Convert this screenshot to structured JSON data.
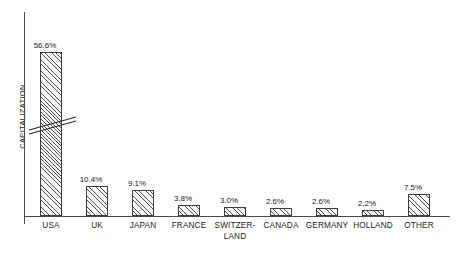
{
  "chart_data": {
    "type": "bar",
    "title": "",
    "xlabel": "",
    "ylabel": "CAPITALIZATION",
    "categories": [
      "USA",
      "UK",
      "JAPAN",
      "FRANCE",
      "SWITZER-LAND",
      "CANADA",
      "GERMANY",
      "HOLLAND",
      "OTHER"
    ],
    "category_lines": [
      [
        "USA"
      ],
      [
        "UK"
      ],
      [
        "JAPAN"
      ],
      [
        "FRANCE"
      ],
      [
        "SWITZER-",
        "LAND"
      ],
      [
        "CANADA"
      ],
      [
        "GERMANY"
      ],
      [
        "HOLLAND"
      ],
      [
        "OTHER"
      ]
    ],
    "values": [
      56.6,
      10.4,
      9.1,
      3.8,
      3.0,
      2.6,
      2.6,
      2.2,
      7.5
    ],
    "value_labels": [
      "56.6%",
      "10.4%",
      "9.1%",
      "3.8%",
      "3.0%",
      "2.6%",
      "2.6%",
      "2.2%",
      "7.5%"
    ],
    "unit": "%",
    "ylim": [
      0,
      60
    ],
    "grid": false,
    "legend": false,
    "axis_break": {
      "present": true,
      "on_category": "USA",
      "note": "broken axis slash marks across USA bar"
    },
    "colors": {
      "bar_outline": "#3d3d3d",
      "bar_hatch": "#464646",
      "bar_fill": "#fdfdfd",
      "axis": "#4a4a4a",
      "text": "#1a1a1a",
      "background": "#ffffff"
    }
  }
}
